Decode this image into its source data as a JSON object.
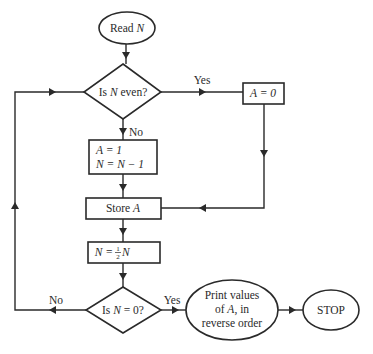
{
  "diagram": {
    "type": "flowchart",
    "colors": {
      "stroke": "#2a2a2a",
      "background": "#ffffff"
    },
    "nodes": {
      "read": {
        "shape": "ellipse",
        "text_plain": "Read ",
        "text_var": "N"
      },
      "even_check": {
        "shape": "diamond",
        "text_a": "Is ",
        "text_var": "N",
        "text_b": " even?"
      },
      "set_zero": {
        "shape": "rectangle",
        "text": "A = 0"
      },
      "set_one": {
        "shape": "rectangle",
        "line1": "A = 1",
        "line2": "N = N − 1"
      },
      "store": {
        "shape": "rectangle",
        "text_plain": "Store ",
        "text_var": "A"
      },
      "halve": {
        "shape": "rectangle",
        "text_a": "N = ",
        "frac_num": "1",
        "frac_den": "2",
        "text_b": "N"
      },
      "zero_check": {
        "shape": "diamond",
        "text_a": "Is ",
        "text_var": "N",
        "text_b": " = 0?"
      },
      "print": {
        "shape": "ellipse",
        "line1": "Print values",
        "line2_a": "of ",
        "line2_var": "A",
        "line2_b": ", in",
        "line3": "reverse order"
      },
      "stop": {
        "shape": "ellipse",
        "text": "STOP"
      }
    },
    "edges": [
      {
        "from": "read",
        "to": "even_check",
        "label": ""
      },
      {
        "from": "even_check",
        "to": "set_zero",
        "label": "Yes"
      },
      {
        "from": "even_check",
        "to": "set_one",
        "label": "No"
      },
      {
        "from": "set_zero",
        "to": "store",
        "label": ""
      },
      {
        "from": "set_one",
        "to": "store",
        "label": ""
      },
      {
        "from": "store",
        "to": "halve",
        "label": ""
      },
      {
        "from": "halve",
        "to": "zero_check",
        "label": ""
      },
      {
        "from": "zero_check",
        "to": "print",
        "label": "Yes"
      },
      {
        "from": "zero_check",
        "to": "even_check",
        "label": "No"
      },
      {
        "from": "print",
        "to": "stop",
        "label": ""
      }
    ],
    "labels": {
      "even_yes": "Yes",
      "even_no": "No",
      "zero_yes": "Yes",
      "zero_no": "No"
    }
  }
}
